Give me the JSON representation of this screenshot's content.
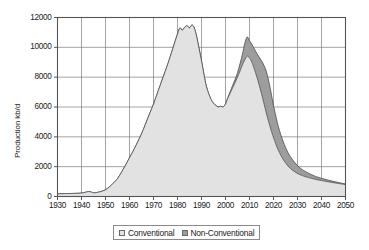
{
  "chart_data": {
    "type": "area",
    "stacked": true,
    "title": "",
    "subtitle": "",
    "xlabel": "",
    "ylabel": "Production kb/d",
    "xlim": [
      1930,
      2050
    ],
    "ylim": [
      0,
      12000
    ],
    "grid": true,
    "legend_position": "bottom",
    "x_ticks": [
      "1930",
      "1940",
      "1950",
      "1960",
      "1970",
      "1980",
      "1990",
      "2000",
      "2010",
      "2020",
      "2030",
      "2040",
      "2050"
    ],
    "y_ticks": [
      "0",
      "2000",
      "4000",
      "6000",
      "8000",
      "10000",
      "12000"
    ],
    "x": [
      1930,
      1935,
      1940,
      1943,
      1945,
      1946,
      1948,
      1950,
      1952,
      1955,
      1958,
      1960,
      1962,
      1965,
      1968,
      1970,
      1972,
      1974,
      1976,
      1978,
      1980,
      1981,
      1982,
      1983,
      1984,
      1985,
      1986,
      1987,
      1988,
      1990,
      1991,
      1992,
      1993,
      1994,
      1995,
      1996,
      1997,
      1998,
      1999,
      2000,
      2001,
      2003,
      2005,
      2007,
      2008,
      2009,
      2010,
      2011,
      2012,
      2013,
      2014,
      2015,
      2016,
      2017,
      2018,
      2019,
      2020,
      2022,
      2024,
      2026,
      2028,
      2030,
      2032,
      2035,
      2038,
      2040,
      2043,
      2046,
      2050
    ],
    "series": [
      {
        "name": "Conventional",
        "color": "#e2e2e2",
        "values": [
          180,
          200,
          230,
          330,
          250,
          260,
          330,
          450,
          700,
          1200,
          2000,
          2600,
          3200,
          4200,
          5400,
          6200,
          7100,
          8000,
          8900,
          9900,
          10900,
          11300,
          11150,
          11350,
          11450,
          11300,
          11500,
          11300,
          10700,
          9100,
          8200,
          7400,
          6900,
          6500,
          6250,
          6100,
          6000,
          6050,
          6000,
          6200,
          6600,
          7300,
          8000,
          8800,
          9150,
          9400,
          9300,
          9000,
          8550,
          8050,
          7500,
          6900,
          6250,
          5600,
          5000,
          4450,
          3950,
          3100,
          2500,
          2050,
          1750,
          1550,
          1400,
          1250,
          1130,
          1070,
          980,
          900,
          800
        ]
      },
      {
        "name": "Non-Conventional",
        "color": "#9d9d9d",
        "values": [
          0,
          0,
          0,
          0,
          0,
          0,
          0,
          0,
          0,
          0,
          0,
          0,
          0,
          0,
          0,
          0,
          0,
          0,
          0,
          0,
          0,
          0,
          0,
          0,
          0,
          0,
          0,
          0,
          0,
          0,
          0,
          0,
          0,
          0,
          0,
          0,
          0,
          0,
          0,
          0,
          50,
          150,
          300,
          700,
          1100,
          1300,
          1150,
          1200,
          1350,
          1550,
          1850,
          2200,
          2550,
          2800,
          2750,
          2500,
          2150,
          1600,
          1200,
          900,
          700,
          520,
          400,
          280,
          190,
          150,
          110,
          75,
          40
        ]
      }
    ],
    "annotations": []
  },
  "legend": {
    "items": [
      {
        "label": "Conventional",
        "color": "#e2e2e2"
      },
      {
        "label": "Non-Conventional",
        "color": "#9d9d9d"
      }
    ]
  },
  "axes": {
    "y_title": "Production kb/d"
  }
}
